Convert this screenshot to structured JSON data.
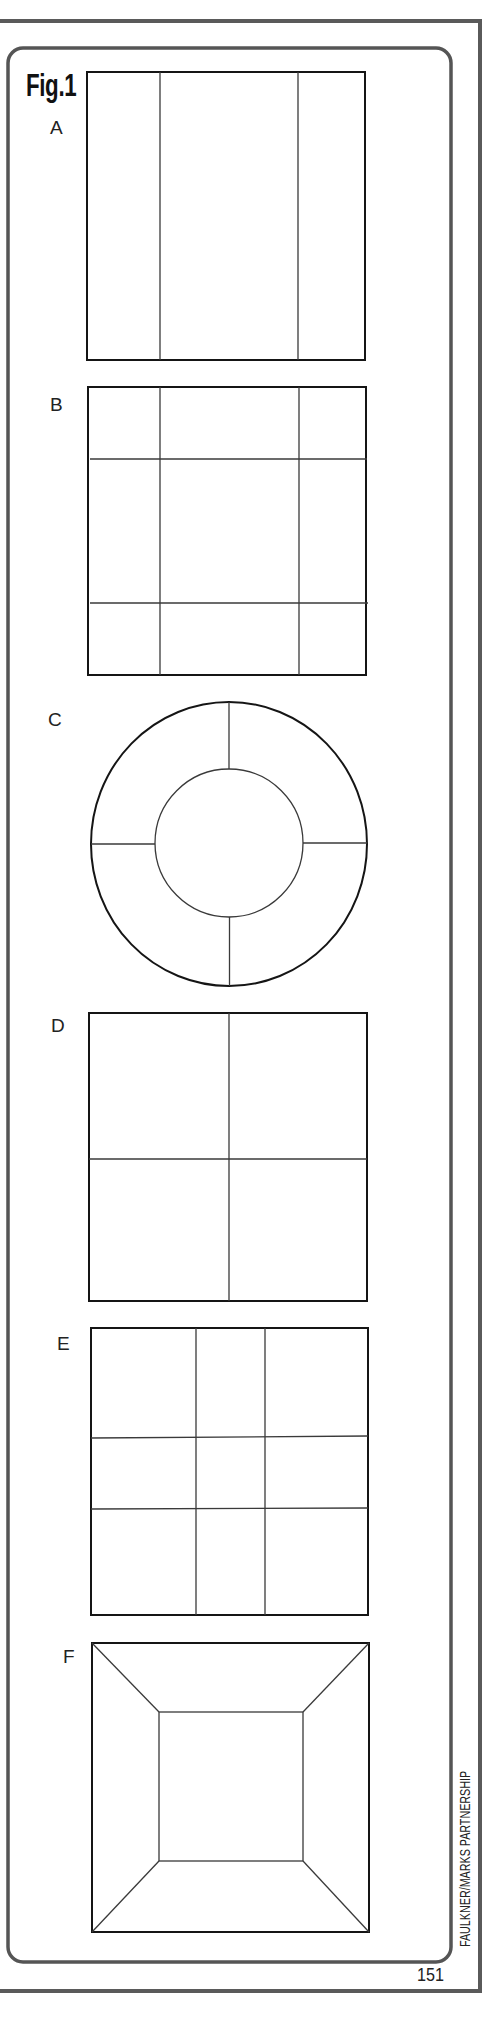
{
  "figure": {
    "title": "Fig.1",
    "page_number": "151",
    "credit": "FAULKNER/MARKS PARTNERSHIP",
    "colors": {
      "frame": "#5a5a5a",
      "outline": "#151515",
      "division": "#3a3a3a",
      "background": "#ffffff"
    }
  },
  "panels": [
    {
      "label": "A",
      "shape": "square",
      "description": "square divided by two vertical lines into three columns (narrow-wide-narrow)"
    },
    {
      "label": "B",
      "shape": "square",
      "description": "square divided by two vertical and two horizontal lines into a 3x3 grid with large centre"
    },
    {
      "label": "C",
      "shape": "circle",
      "description": "circle with concentric inner circle; ring split into four segments by radial lines"
    },
    {
      "label": "D",
      "shape": "square",
      "description": "square divided into four equal quarters"
    },
    {
      "label": "E",
      "shape": "square",
      "description": "square divided into 3x3 grid with narrow centre column and centre row"
    },
    {
      "label": "F",
      "shape": "square",
      "description": "square with inner square, corners joined by diagonal lines (mitred frame)"
    }
  ]
}
